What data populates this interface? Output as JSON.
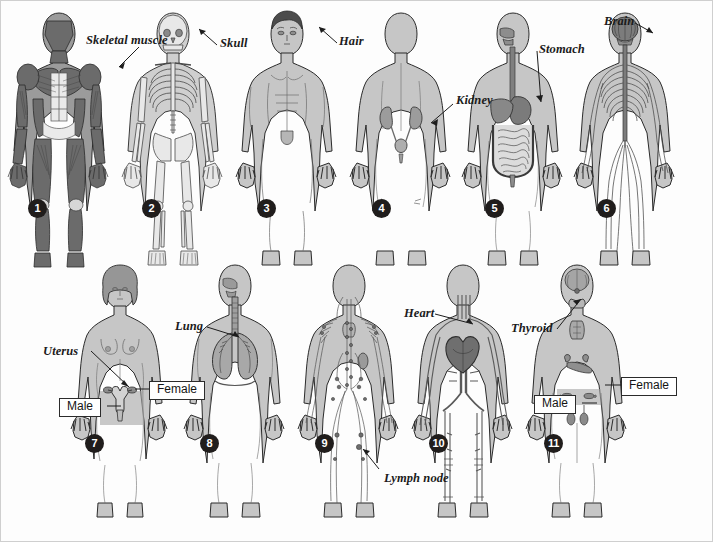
{
  "page": {
    "background_color": "#fdfdfd",
    "border_color": "#cfcfcf",
    "width": 713,
    "height": 542,
    "rows": 2,
    "figures_per_row": [
      6,
      5
    ]
  },
  "style": {
    "badge_fill": "#201d1c",
    "badge_text_color": "#ffffff",
    "label_color": "#1b1b1b",
    "body_fill": "#c9c9c9",
    "body_outline": "#2a2a2a",
    "organ_dark": "#7d7d7d",
    "organ_mid": "#9a9a9a",
    "muscle_dark": "#6f6f6f",
    "sex_box_border": "#2b2b2b",
    "sex_box_fill": "#ffffff"
  },
  "figures": [
    {
      "number": "1",
      "system": "muscular-system",
      "badge": {
        "x": 27,
        "y": 198
      },
      "callouts": [
        {
          "text": "Skeletal muscle",
          "x": 85,
          "y": 38,
          "leader_to_x": 108,
          "leader_to_y": 67
        }
      ]
    },
    {
      "number": "2",
      "system": "skeletal-system",
      "badge": {
        "x": 141,
        "y": 198
      },
      "callouts": [
        {
          "text": "Skull",
          "x": 219,
          "y": 40,
          "leader_to_x": 196,
          "leader_to_y": 26
        }
      ]
    },
    {
      "number": "3",
      "system": "integumentary-system",
      "badge": {
        "x": 256,
        "y": 198
      },
      "callouts": [
        {
          "text": "Hair",
          "x": 338,
          "y": 38,
          "leader_to_x": 316,
          "leader_to_y": 24
        }
      ]
    },
    {
      "number": "4",
      "system": "urinary-system",
      "badge": {
        "x": 371,
        "y": 198
      },
      "callouts": [
        {
          "text": "Kidney",
          "x": 455,
          "y": 93,
          "leader_to_x": 428,
          "leader_to_y": 122
        }
      ]
    },
    {
      "number": "5",
      "system": "digestive-system",
      "badge": {
        "x": 484,
        "y": 198
      },
      "callouts": [
        {
          "text": "Stomach",
          "x": 538,
          "y": 42,
          "leader_to_x": 537,
          "leader_to_y": 103
        }
      ]
    },
    {
      "number": "6",
      "system": "nervous-system",
      "badge": {
        "x": 596,
        "y": 198
      },
      "callouts": [
        {
          "text": "Brain",
          "x": 603,
          "y": 14,
          "leader_to_x": 650,
          "leader_to_y": 32
        }
      ]
    },
    {
      "number": "7",
      "system": "reproductive-system",
      "badge": {
        "x": 84,
        "y": 433
      },
      "callouts": [
        {
          "text": "Uterus",
          "x": 45,
          "y": 344,
          "leader_to_x": 124,
          "leader_to_y": 383
        }
      ],
      "sex_labels": [
        {
          "text": "Male",
          "x": 58,
          "y": 397
        },
        {
          "text": "Female",
          "x": 150,
          "y": 380
        }
      ]
    },
    {
      "number": "8",
      "system": "respiratory-system",
      "badge": {
        "x": 199,
        "y": 433
      },
      "callouts": [
        {
          "text": "Lung",
          "x": 176,
          "y": 320,
          "leader_to_x": 236,
          "leader_to_y": 334
        }
      ]
    },
    {
      "number": "9",
      "system": "lymphatic-system",
      "badge": {
        "x": 314,
        "y": 433
      },
      "callouts": [
        {
          "text": "Lymph node",
          "x": 383,
          "y": 472,
          "leader_to_x": 378,
          "leader_to_y": 448
        }
      ]
    },
    {
      "number": "10",
      "system": "cardiovascular-system",
      "badge": {
        "x": 428,
        "y": 433
      },
      "callouts": [
        {
          "text": "Heart",
          "x": 404,
          "y": 307,
          "leader_to_x": 470,
          "leader_to_y": 321
        }
      ]
    },
    {
      "number": "11",
      "system": "endocrine-system",
      "badge": {
        "x": 543,
        "y": 433
      },
      "callouts": [
        {
          "text": "Thyroid",
          "x": 512,
          "y": 322,
          "leader_to_x": 578,
          "leader_to_y": 297
        }
      ],
      "sex_labels": [
        {
          "text": "Male",
          "x": 533,
          "y": 394
        },
        {
          "text": "Female",
          "x": 622,
          "y": 376
        }
      ]
    }
  ]
}
